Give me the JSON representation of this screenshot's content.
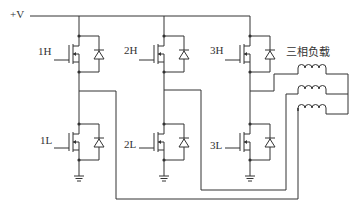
{
  "diagram": {
    "type": "three-phase MOSFET inverter bridge",
    "supply_label": "+V",
    "load_label": "三相负载",
    "colors": {
      "wire": "#333333",
      "background": "#ffffff"
    },
    "switches": {
      "high": [
        {
          "label": "1H"
        },
        {
          "label": "2H"
        },
        {
          "label": "3H"
        }
      ],
      "low": [
        {
          "label": "1L"
        },
        {
          "label": "2L"
        },
        {
          "label": "3L"
        }
      ]
    },
    "load": {
      "coils": 3
    }
  }
}
